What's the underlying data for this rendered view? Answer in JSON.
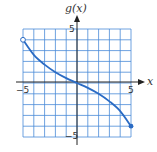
{
  "chart_data": {
    "type": "line",
    "title": "",
    "xlabel": "x",
    "ylabel": "g(x)",
    "xlim": [
      -5,
      5
    ],
    "ylim": [
      -5,
      5
    ],
    "grid": true,
    "x_ticks_labeled": [
      "-5",
      "5"
    ],
    "y_ticks_labeled": [
      "5",
      "-5"
    ],
    "series": [
      {
        "name": "g(x)",
        "x": [
          -5,
          -4,
          -3,
          -2,
          -1,
          0,
          1,
          2,
          3,
          4,
          5
        ],
        "values": [
          4,
          2.6,
          1.7,
          1.0,
          0.45,
          0,
          -0.45,
          -1.0,
          -1.7,
          -2.6,
          -4
        ]
      }
    ],
    "endpoints": [
      {
        "x": -5,
        "y": 4,
        "style": "open"
      },
      {
        "x": 5,
        "y": -4,
        "style": "closed"
      }
    ],
    "colors": {
      "grid": "#3b7fd4",
      "curve": "#2a6bc4",
      "axis": "#222222"
    }
  },
  "labels": {
    "ylabel": "g(x)",
    "xlabel": "x",
    "x_neg": "−5",
    "x_pos": "5",
    "y_pos": "5",
    "y_neg": "−5"
  }
}
